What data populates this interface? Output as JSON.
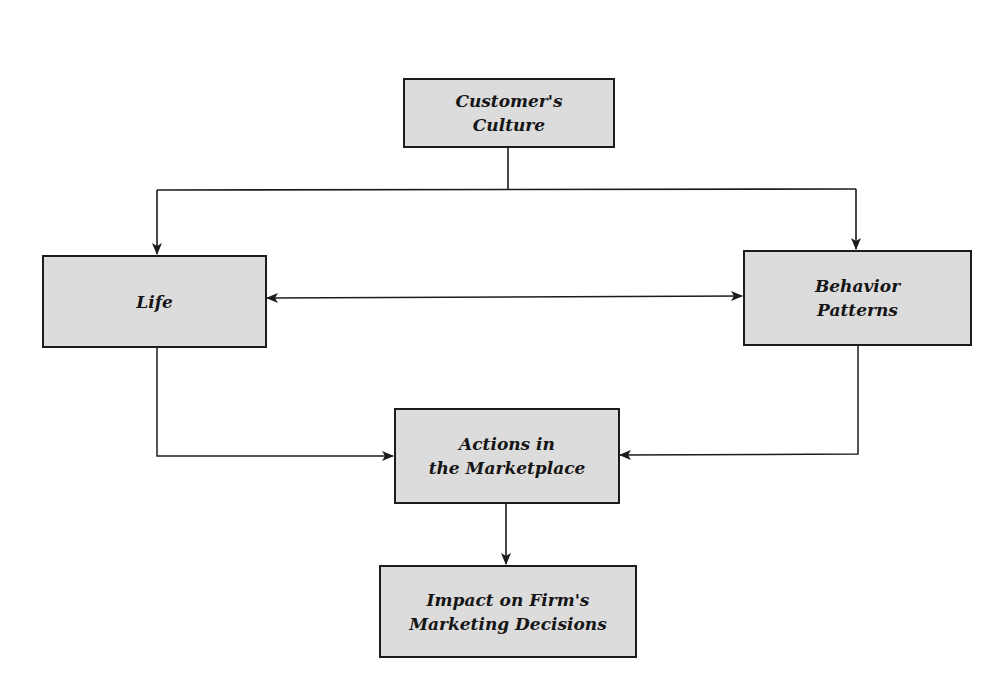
{
  "diagram": {
    "type": "flowchart",
    "colors": {
      "box_fill": "#dcdcdc",
      "box_border": "#1c1c1c",
      "line": "#1c1c1c",
      "background": "#ffffff"
    },
    "nodes": {
      "culture": {
        "label": "Customer's\nCulture"
      },
      "life": {
        "label": "Life"
      },
      "behavior": {
        "label": "Behavior\nPatterns"
      },
      "actions": {
        "label": "Actions in\nthe Marketplace"
      },
      "impact": {
        "label": "Impact on Firm's\nMarketing Decisions"
      }
    },
    "edges": [
      {
        "from": "culture",
        "to": "life",
        "direction": "forward"
      },
      {
        "from": "culture",
        "to": "behavior",
        "direction": "forward"
      },
      {
        "from": "life",
        "to": "behavior",
        "direction": "bidirectional"
      },
      {
        "from": "life",
        "to": "actions",
        "direction": "forward"
      },
      {
        "from": "behavior",
        "to": "actions",
        "direction": "forward"
      },
      {
        "from": "actions",
        "to": "impact",
        "direction": "forward"
      }
    ]
  }
}
